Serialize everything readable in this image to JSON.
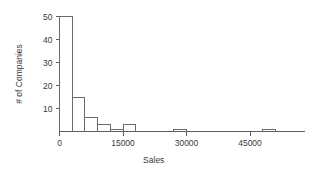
{
  "chart_data": {
    "type": "bar",
    "title": "",
    "subtitle": "",
    "xlabel": "Sales",
    "ylabel": "# of Companies",
    "grid": false,
    "legend": false,
    "legend_position": "none",
    "xlim": [
      -2500,
      58000
    ],
    "ylim": [
      0,
      52
    ],
    "bin_width": 3000,
    "xticks": [
      0,
      15000,
      30000,
      45000
    ],
    "xtick_labels": [
      "0",
      "15000",
      "30000",
      "45000"
    ],
    "yticks": [
      10,
      20,
      30,
      40,
      50
    ],
    "ytick_labels": [
      "10",
      "20",
      "30",
      "40",
      "50"
    ],
    "bins": [
      {
        "x0": 0,
        "x1": 3000,
        "count": 50
      },
      {
        "x0": 3000,
        "x1": 6000,
        "count": 15
      },
      {
        "x0": 6000,
        "x1": 9000,
        "count": 6
      },
      {
        "x0": 9000,
        "x1": 12000,
        "count": 3
      },
      {
        "x0": 12000,
        "x1": 15000,
        "count": 1
      },
      {
        "x0": 15000,
        "x1": 18000,
        "count": 3
      },
      {
        "x0": 27000,
        "x1": 30000,
        "count": 1
      },
      {
        "x0": 48000,
        "x1": 51000,
        "count": 1
      }
    ],
    "categories": [
      "0-3000",
      "3000-6000",
      "6000-9000",
      "9000-12000",
      "12000-15000",
      "15000-18000",
      "27000-30000",
      "48000-51000"
    ],
    "values": [
      50,
      15,
      6,
      3,
      1,
      3,
      1,
      1
    ],
    "colors": {
      "bar_stroke": "#6b6b6b",
      "bar_fill": "#ffffff",
      "axis": "#5d5d5d",
      "text": "#3a3a3a",
      "background": "#ffffff"
    }
  }
}
